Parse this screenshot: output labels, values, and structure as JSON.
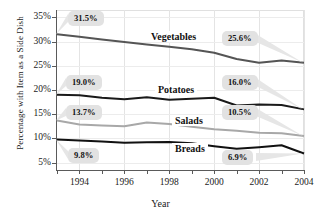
{
  "chart_data": {
    "type": "line",
    "title": "",
    "xlabel": "Year",
    "ylabel": "Percentage with Item as a Side Dish",
    "x": [
      1993,
      1994,
      1995,
      1996,
      1997,
      1998,
      1999,
      2000,
      2001,
      2002,
      2003,
      2004
    ],
    "xlim": [
      1993,
      2004
    ],
    "ylim": [
      3.5,
      36.5
    ],
    "yticks": [
      "5%",
      "10%",
      "15%",
      "20%",
      "25%",
      "30%",
      "35%"
    ],
    "ytick_values": [
      5,
      10,
      15,
      20,
      25,
      30,
      35
    ],
    "xticks": [
      "1994",
      "1996",
      "1998",
      "2000",
      "2002",
      "2004"
    ],
    "xtick_values": [
      1994,
      1996,
      1998,
      2000,
      2002,
      2004
    ],
    "grid": true,
    "legend": "inline-series-labels",
    "series": [
      {
        "name": "Vegetables",
        "color": "#555555",
        "values": [
          31.5,
          31.0,
          30.4,
          29.9,
          29.4,
          28.9,
          28.4,
          27.7,
          26.4,
          25.6,
          26.1,
          25.6
        ]
      },
      {
        "name": "Potatoes",
        "color": "#1a1a1a",
        "values": [
          19.0,
          18.9,
          18.4,
          18.1,
          18.5,
          18.0,
          18.2,
          18.4,
          16.8,
          17.0,
          16.9,
          16.0
        ]
      },
      {
        "name": "Salads",
        "color": "#a8a8a8",
        "values": [
          13.7,
          12.9,
          12.7,
          12.5,
          13.3,
          13.0,
          12.4,
          11.9,
          11.6,
          11.2,
          11.1,
          10.5
        ]
      },
      {
        "name": "Breads",
        "color": "#111111",
        "values": [
          9.8,
          9.6,
          9.4,
          9.1,
          9.2,
          9.3,
          9.0,
          8.4,
          7.9,
          8.2,
          8.6,
          6.9
        ]
      }
    ],
    "annotations": [
      {
        "label": "31.5%",
        "series": "Vegetables",
        "x": 1993,
        "y": 31.5,
        "side": "start"
      },
      {
        "label": "25.6%",
        "series": "Vegetables",
        "x": 2004,
        "y": 25.6,
        "side": "end"
      },
      {
        "label": "19.0%",
        "series": "Potatoes",
        "x": 1993,
        "y": 19.0,
        "side": "start"
      },
      {
        "label": "16.0%",
        "series": "Potatoes",
        "x": 2004,
        "y": 16.0,
        "side": "end"
      },
      {
        "label": "13.7%",
        "series": "Salads",
        "x": 1993,
        "y": 13.7,
        "side": "start"
      },
      {
        "label": "10.5%",
        "series": "Salads",
        "x": 2004,
        "y": 10.5,
        "side": "end"
      },
      {
        "label": "9.8%",
        "series": "Breads",
        "x": 1993,
        "y": 9.8,
        "side": "start"
      },
      {
        "label": "6.9%",
        "series": "Breads",
        "x": 2004,
        "y": 6.9,
        "side": "end"
      }
    ]
  }
}
